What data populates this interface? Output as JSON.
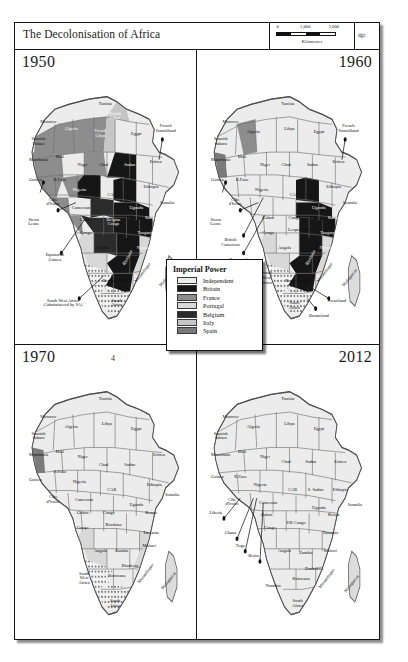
{
  "figure": {
    "title": "The Decolonisation of Africa",
    "figure_number": "4",
    "credit": "dgc",
    "scale": {
      "ticks": [
        "0",
        "1,000",
        "2,000"
      ],
      "units": "Kilometres"
    }
  },
  "legend": {
    "title": "Imperial Power",
    "items": [
      {
        "label": "Independent",
        "color": "#ececec"
      },
      {
        "label": "Britain",
        "color": "#161616"
      },
      {
        "label": "France",
        "color": "#8d8d8d"
      },
      {
        "label": "Portugal",
        "color": "#d8d8d8"
      },
      {
        "label": "Belgium",
        "color": "#2b2b2b"
      },
      {
        "label": "Italy",
        "color": "#c6c6c6"
      },
      {
        "label": "Spain",
        "color": "#7a7a7a"
      }
    ]
  },
  "panels": [
    {
      "year": "1950",
      "year_align": "left",
      "labels": [
        {
          "t": "Morocco",
          "x": 16,
          "y": 18,
          "c": "dark"
        },
        {
          "t": "Tunisia",
          "x": 51,
          "y": 11,
          "c": "dark"
        },
        {
          "t": "Algeria",
          "x": 30,
          "y": 21,
          "c": "light"
        },
        {
          "t": "Spanish\nSahara",
          "x": 10,
          "y": 26,
          "c": "dark"
        },
        {
          "t": "British\nLibya",
          "x": 57,
          "y": 16,
          "c": "light"
        },
        {
          "t": "French\nLibya",
          "x": 48,
          "y": 23,
          "c": "light"
        },
        {
          "t": "Egypt",
          "x": 70,
          "y": 23,
          "c": "dark"
        },
        {
          "t": "Mauritania",
          "x": 10,
          "y": 33,
          "c": "dark"
        },
        {
          "t": "Mali",
          "x": 23,
          "y": 32,
          "c": "dark"
        },
        {
          "t": "Niger",
          "x": 37,
          "y": 35,
          "c": "dark"
        },
        {
          "t": "Chad",
          "x": 50,
          "y": 35,
          "c": "dark"
        },
        {
          "t": "Sudan",
          "x": 66,
          "y": 35,
          "c": "light"
        },
        {
          "t": "Eritrea",
          "x": 82,
          "y": 34,
          "c": "dark"
        },
        {
          "t": "French\nSomaliland",
          "x": 88,
          "y": 21,
          "c": "dark"
        },
        {
          "t": "Guinea",
          "x": 8,
          "y": 41,
          "c": "dark"
        },
        {
          "t": "B.Faso",
          "x": 23,
          "y": 41,
          "c": "dark"
        },
        {
          "t": "Nigeria",
          "x": 35,
          "y": 45,
          "c": "light"
        },
        {
          "t": "CAR",
          "x": 55,
          "y": 47,
          "c": "dark"
        },
        {
          "t": "Ethiopia",
          "x": 79,
          "y": 44,
          "c": "dark"
        },
        {
          "t": "Côte\nd'Ivoire",
          "x": 19,
          "y": 50,
          "c": "dark"
        },
        {
          "t": "Cameroon",
          "x": 36,
          "y": 52,
          "c": "dark"
        },
        {
          "t": "Sierra\nLeone",
          "x": 7,
          "y": 58,
          "c": "dark"
        },
        {
          "t": "Gabon",
          "x": 39,
          "y": 57,
          "c": "dark"
        },
        {
          "t": "Congo",
          "x": 39,
          "y": 62,
          "c": "dark"
        },
        {
          "t": "Belgian\nCongo",
          "x": 56,
          "y": 58,
          "c": "light"
        },
        {
          "t": "Uganda",
          "x": 70,
          "y": 52,
          "c": "light"
        },
        {
          "t": "Kenya",
          "x": 79,
          "y": 56,
          "c": "light"
        },
        {
          "t": "Somalia",
          "x": 89,
          "y": 50,
          "c": "dark"
        },
        {
          "t": "Tanganyika",
          "x": 77,
          "y": 62,
          "c": "light"
        },
        {
          "t": "Angola",
          "x": 49,
          "y": 68,
          "c": "dark"
        },
        {
          "t": "Nyasaland",
          "x": 76,
          "y": 68,
          "c": "light"
        },
        {
          "t": "Rhodesia",
          "x": 65,
          "y": 72,
          "c": "wrot"
        },
        {
          "t": "Mozambique",
          "x": 74,
          "y": 78,
          "c": "rot2"
        },
        {
          "t": "Madagascar",
          "x": 89,
          "y": 80,
          "c": "rot2"
        },
        {
          "t": "Bechuanaland",
          "x": 57,
          "y": 81,
          "c": "dark"
        },
        {
          "t": "South\nAfrica",
          "x": 58,
          "y": 90,
          "c": "dark"
        },
        {
          "t": "Equatorial\nGuinea",
          "x": 20,
          "y": 72,
          "c": "dark"
        },
        {
          "t": "South West Africa\n(Administered by SA)",
          "x": 25,
          "y": 90,
          "c": "dark"
        }
      ],
      "leaders": [
        [
          13,
          42,
          11,
          46
        ],
        [
          22,
          53,
          33,
          50
        ],
        [
          24,
          70,
          38,
          57
        ],
        [
          35,
          88,
          50,
          79
        ],
        [
          86,
          25,
          84,
          33
        ]
      ]
    },
    {
      "year": "1960",
      "year_align": "right",
      "labels": [
        {
          "t": "Morocco",
          "x": 16,
          "y": 18,
          "c": "dark"
        },
        {
          "t": "Tunisia",
          "x": 51,
          "y": 11,
          "c": "dark"
        },
        {
          "t": "Algeria",
          "x": 30,
          "y": 22,
          "c": "dark"
        },
        {
          "t": "Spanish\nSahara",
          "x": 10,
          "y": 26,
          "c": "dark"
        },
        {
          "t": "Libya",
          "x": 52,
          "y": 21,
          "c": "dark"
        },
        {
          "t": "Egypt",
          "x": 70,
          "y": 22,
          "c": "dark"
        },
        {
          "t": "Mauritania",
          "x": 10,
          "y": 33,
          "c": "dark"
        },
        {
          "t": "Mali",
          "x": 23,
          "y": 32,
          "c": "dark"
        },
        {
          "t": "Niger",
          "x": 37,
          "y": 35,
          "c": "dark"
        },
        {
          "t": "Chad",
          "x": 50,
          "y": 35,
          "c": "dark"
        },
        {
          "t": "Sudan",
          "x": 66,
          "y": 35,
          "c": "dark"
        },
        {
          "t": "Eritrea",
          "x": 82,
          "y": 34,
          "c": "dark"
        },
        {
          "t": "French\nSomaliland",
          "x": 88,
          "y": 21,
          "c": "dark"
        },
        {
          "t": "Guinea",
          "x": 8,
          "y": 41,
          "c": "dark"
        },
        {
          "t": "B.Faso",
          "x": 23,
          "y": 41,
          "c": "dark"
        },
        {
          "t": "Nigeria",
          "x": 35,
          "y": 45,
          "c": "dark"
        },
        {
          "t": "CAR",
          "x": 55,
          "y": 47,
          "c": "dark"
        },
        {
          "t": "Ethiopia",
          "x": 79,
          "y": 44,
          "c": "dark"
        },
        {
          "t": "Côte\nd'Ivoire",
          "x": 19,
          "y": 50,
          "c": "dark"
        },
        {
          "t": "Sierra\nLeone",
          "x": 7,
          "y": 58,
          "c": "dark"
        },
        {
          "t": "Gabon",
          "x": 39,
          "y": 56,
          "c": "dark"
        },
        {
          "t": "Congo",
          "x": 39,
          "y": 62,
          "c": "dark"
        },
        {
          "t": "Congo",
          "x": 55,
          "y": 56,
          "c": "dark"
        },
        {
          "t": "Leopoldville",
          "x": 58,
          "y": 61,
          "c": "dark"
        },
        {
          "t": "British\nCameroon",
          "x": 16,
          "y": 66,
          "c": "dark"
        },
        {
          "t": "Uganda",
          "x": 70,
          "y": 52,
          "c": "light"
        },
        {
          "t": "Kenya",
          "x": 79,
          "y": 56,
          "c": "light"
        },
        {
          "t": "Somalia",
          "x": 89,
          "y": 50,
          "c": "dark"
        },
        {
          "t": "Tanganyika",
          "x": 77,
          "y": 62,
          "c": "light"
        },
        {
          "t": "Angola",
          "x": 49,
          "y": 68,
          "c": "dark"
        },
        {
          "t": "Nyasaland",
          "x": 76,
          "y": 68,
          "c": "light"
        },
        {
          "t": "Rhodesia",
          "x": 65,
          "y": 72,
          "c": "wrot"
        },
        {
          "t": "Mozambique",
          "x": 74,
          "y": 78,
          "c": "rot2"
        },
        {
          "t": "Madagascar",
          "x": 89,
          "y": 80,
          "c": "rot2"
        },
        {
          "t": "Bechuanaland",
          "x": 57,
          "y": 81,
          "c": "dark"
        },
        {
          "t": "South\nWest\nAfrica",
          "x": 38,
          "y": 80,
          "c": "dark"
        },
        {
          "t": "South\nAfrica",
          "x": 55,
          "y": 91,
          "c": "dark"
        },
        {
          "t": "Equatorial\nGuinea",
          "x": 21,
          "y": 74,
          "c": "dark"
        },
        {
          "t": "Swaziland",
          "x": 81,
          "y": 89,
          "c": "dark"
        },
        {
          "t": "Basutoland",
          "x": 70,
          "y": 95,
          "c": "dark"
        }
      ],
      "leaders": [
        [
          13,
          42,
          11,
          46
        ],
        [
          22,
          53,
          33,
          50
        ],
        [
          24,
          70,
          37,
          55
        ],
        [
          24,
          63,
          36,
          48
        ],
        [
          86,
          25,
          84,
          33
        ],
        [
          76,
          88,
          66,
          84
        ],
        [
          68,
          92,
          63,
          88
        ]
      ]
    },
    {
      "year": "1970",
      "year_align": "left",
      "labels": [
        {
          "t": "Morocco",
          "x": 16,
          "y": 18,
          "c": "dark"
        },
        {
          "t": "Tunisia",
          "x": 51,
          "y": 11,
          "c": "dark"
        },
        {
          "t": "Algeria",
          "x": 30,
          "y": 22,
          "c": "dark"
        },
        {
          "t": "Spanish\nSahara",
          "x": 10,
          "y": 26,
          "c": "dark"
        },
        {
          "t": "Libya",
          "x": 52,
          "y": 21,
          "c": "dark"
        },
        {
          "t": "Egypt",
          "x": 70,
          "y": 23,
          "c": "dark"
        },
        {
          "t": "Mauritania",
          "x": 10,
          "y": 33,
          "c": "dark"
        },
        {
          "t": "Mali",
          "x": 23,
          "y": 32,
          "c": "dark"
        },
        {
          "t": "Niger",
          "x": 37,
          "y": 34,
          "c": "dark"
        },
        {
          "t": "Chad",
          "x": 50,
          "y": 37,
          "c": "dark"
        },
        {
          "t": "Sudan",
          "x": 66,
          "y": 37,
          "c": "dark"
        },
        {
          "t": "Eritrea",
          "x": 84,
          "y": 33,
          "c": "dark"
        },
        {
          "t": "Guinea",
          "x": 8,
          "y": 43,
          "c": "dark"
        },
        {
          "t": "B.Faso",
          "x": 23,
          "y": 40,
          "c": "dark"
        },
        {
          "t": "Nigeria",
          "x": 35,
          "y": 44,
          "c": "dark"
        },
        {
          "t": "CAR",
          "x": 55,
          "y": 47,
          "c": "dark"
        },
        {
          "t": "Ethiopia",
          "x": 81,
          "y": 45,
          "c": "dark"
        },
        {
          "t": "Somalia",
          "x": 92,
          "y": 49,
          "c": "dark"
        },
        {
          "t": "Côte\nd'Ivoire",
          "x": 19,
          "y": 51,
          "c": "dark"
        },
        {
          "t": "Cameroon",
          "x": 38,
          "y": 51,
          "c": "dark"
        },
        {
          "t": "Gabon",
          "x": 37,
          "y": 56,
          "c": "dark"
        },
        {
          "t": "Congo",
          "x": 37,
          "y": 62,
          "c": "dark"
        },
        {
          "t": "Congo",
          "x": 53,
          "y": 56,
          "c": "dark"
        },
        {
          "t": "Kinshasa",
          "x": 56,
          "y": 61,
          "c": "dark"
        },
        {
          "t": "Uganda",
          "x": 70,
          "y": 53,
          "c": "dark"
        },
        {
          "t": "Kenya",
          "x": 79,
          "y": 56,
          "c": "dark"
        },
        {
          "t": "Tanzania",
          "x": 79,
          "y": 64,
          "c": "dark"
        },
        {
          "t": "Angola",
          "x": 48,
          "y": 71,
          "c": "dark"
        },
        {
          "t": "Zambia",
          "x": 61,
          "y": 71,
          "c": "dark"
        },
        {
          "t": "Malawi",
          "x": 78,
          "y": 69,
          "c": "dark"
        },
        {
          "t": "Rhodesia",
          "x": 66,
          "y": 77,
          "c": "dark"
        },
        {
          "t": "Botswana",
          "x": 58,
          "y": 81,
          "c": "dark"
        },
        {
          "t": "Mozambique",
          "x": 76,
          "y": 80,
          "c": "rot2"
        },
        {
          "t": "Madagascar",
          "x": 90,
          "y": 83,
          "c": "rot2"
        },
        {
          "t": "South\nWest\nAfrica",
          "x": 38,
          "y": 82,
          "c": "dark"
        },
        {
          "t": "South\nAfrica",
          "x": 57,
          "y": 92,
          "c": "dark"
        }
      ],
      "leaders": []
    },
    {
      "year": "2012",
      "year_align": "right",
      "labels": [
        {
          "t": "Morocco",
          "x": 16,
          "y": 18,
          "c": "dark"
        },
        {
          "t": "Tunisia",
          "x": 51,
          "y": 11,
          "c": "dark"
        },
        {
          "t": "Algeria",
          "x": 30,
          "y": 22,
          "c": "dark"
        },
        {
          "t": "Spanish\nSahara",
          "x": 10,
          "y": 26,
          "c": "dark"
        },
        {
          "t": "Libya",
          "x": 52,
          "y": 21,
          "c": "dark"
        },
        {
          "t": "Egypt",
          "x": 70,
          "y": 23,
          "c": "dark"
        },
        {
          "t": "Mauritania",
          "x": 10,
          "y": 33,
          "c": "dark"
        },
        {
          "t": "Mali",
          "x": 23,
          "y": 32,
          "c": "dark"
        },
        {
          "t": "Niger",
          "x": 37,
          "y": 34,
          "c": "dark"
        },
        {
          "t": "Chad",
          "x": 50,
          "y": 36,
          "c": "dark"
        },
        {
          "t": "Sudan",
          "x": 65,
          "y": 36,
          "c": "dark"
        },
        {
          "t": "Eritrea",
          "x": 83,
          "y": 36,
          "c": "dark"
        },
        {
          "t": "Guinea",
          "x": 8,
          "y": 42,
          "c": "dark"
        },
        {
          "t": "B.Faso",
          "x": 22,
          "y": 42,
          "c": "dark"
        },
        {
          "t": "Nigeria",
          "x": 34,
          "y": 45,
          "c": "dark"
        },
        {
          "t": "CAR",
          "x": 54,
          "y": 47,
          "c": "dark"
        },
        {
          "t": "S. Sudan",
          "x": 68,
          "y": 47,
          "c": "dark"
        },
        {
          "t": "Ethiopia",
          "x": 83,
          "y": 47,
          "c": "dark"
        },
        {
          "t": "Somalia",
          "x": 92,
          "y": 53,
          "c": "dark"
        },
        {
          "t": "Côte\nd'Ivoire",
          "x": 17,
          "y": 52,
          "c": "dark"
        },
        {
          "t": "Liberia",
          "x": 7,
          "y": 56,
          "c": "dark"
        },
        {
          "t": "Cameroon",
          "x": 39,
          "y": 52,
          "c": "dark"
        },
        {
          "t": "Gabon",
          "x": 38,
          "y": 57,
          "c": "dark"
        },
        {
          "t": "Congo",
          "x": 40,
          "y": 62,
          "c": "dark"
        },
        {
          "t": "DR Congo",
          "x": 56,
          "y": 60,
          "c": "dark"
        },
        {
          "t": "Uganda",
          "x": 70,
          "y": 54,
          "c": "dark"
        },
        {
          "t": "Kenya",
          "x": 79,
          "y": 57,
          "c": "dark"
        },
        {
          "t": "Tanzania",
          "x": 77,
          "y": 64,
          "c": "dark"
        },
        {
          "t": "Ghana",
          "x": 16,
          "y": 64,
          "c": "dark"
        },
        {
          "t": "Togo",
          "x": 22,
          "y": 69,
          "c": "dark"
        },
        {
          "t": "Benin",
          "x": 30,
          "y": 73,
          "c": "dark"
        },
        {
          "t": "Angola",
          "x": 49,
          "y": 71,
          "c": "dark"
        },
        {
          "t": "Zambia",
          "x": 62,
          "y": 72,
          "c": "dark"
        },
        {
          "t": "Malawi",
          "x": 77,
          "y": 71,
          "c": "dark"
        },
        {
          "t": "Zimbabwe",
          "x": 67,
          "y": 78,
          "c": "dark"
        },
        {
          "t": "Botswana",
          "x": 59,
          "y": 82,
          "c": "dark"
        },
        {
          "t": "Namibia",
          "x": 42,
          "y": 85,
          "c": "dark"
        },
        {
          "t": "Mozambique",
          "x": 75,
          "y": 82,
          "c": "rot2"
        },
        {
          "t": "Madagascar",
          "x": 90,
          "y": 84,
          "c": "rot2"
        },
        {
          "t": "South\nAfrica",
          "x": 57,
          "y": 92,
          "c": "dark"
        }
      ],
      "leaders": [
        [
          12,
          58,
          22,
          50
        ],
        [
          20,
          66,
          30,
          50
        ],
        [
          25,
          71,
          32,
          50
        ],
        [
          34,
          75,
          36,
          52
        ]
      ]
    }
  ]
}
